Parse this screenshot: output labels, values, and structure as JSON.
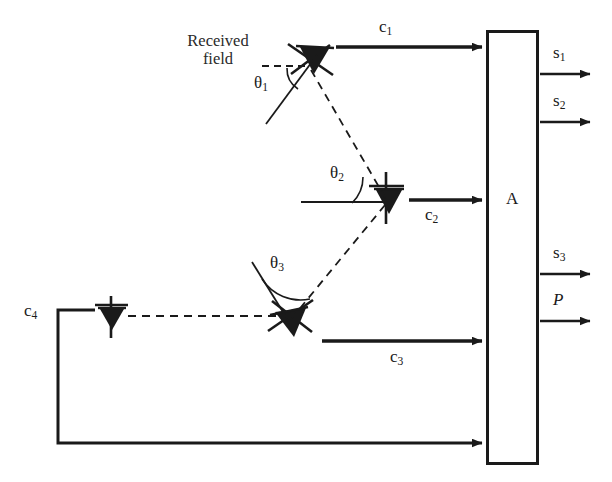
{
  "figure": {
    "type": "antenna-array-block-diagram",
    "background_color": "#ffffff",
    "line_color": "#1a1a1a"
  },
  "annotations": {
    "received_field_line1": "Received",
    "received_field_line2": "field"
  },
  "angles": [
    {
      "id": "theta1",
      "label": "θ",
      "subscript": "1"
    },
    {
      "id": "theta2",
      "label": "θ",
      "subscript": "2"
    },
    {
      "id": "theta3",
      "label": "θ",
      "subscript": "3"
    }
  ],
  "channels": [
    {
      "id": "c1",
      "label": "c",
      "subscript": "1"
    },
    {
      "id": "c2",
      "label": "c",
      "subscript": "2"
    },
    {
      "id": "c3",
      "label": "c",
      "subscript": "3"
    },
    {
      "id": "c4",
      "label": "c",
      "subscript": "4"
    }
  ],
  "processor": {
    "label": "A"
  },
  "outputs": [
    {
      "id": "s1",
      "label": "s",
      "subscript": "1",
      "italic": false
    },
    {
      "id": "s2",
      "label": "s",
      "subscript": "2",
      "italic": false
    },
    {
      "id": "s3",
      "label": "s",
      "subscript": "3",
      "italic": false
    },
    {
      "id": "p",
      "label": "P",
      "subscript": "",
      "italic": true
    }
  ]
}
